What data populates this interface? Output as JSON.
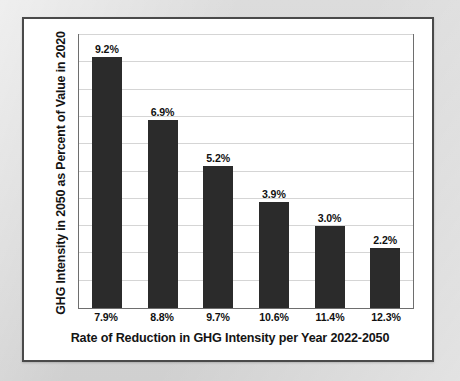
{
  "figure": {
    "background_color": "#d9d9d9",
    "panel_color": "#ffffff",
    "frame_color": "#4a4a4a",
    "bar_color": "#2b2b2b",
    "gridline_color": "#d5d5d5"
  },
  "chart_data": {
    "type": "bar",
    "title": "",
    "xlabel": "Rate of Reduction in GHG Intensity per Year 2022-2050",
    "ylabel": "GHG Intensity in 2050 as Percent of Value in 2020",
    "categories": [
      "7.9%",
      "8.8%",
      "9.7%",
      "10.6%",
      "11.4%",
      "12.3%"
    ],
    "values": [
      9.2,
      6.9,
      5.2,
      3.9,
      3.0,
      2.2
    ],
    "data_labels": [
      "9.2%",
      "6.9%",
      "5.2%",
      "3.9%",
      "3.0%",
      "2.2%"
    ],
    "ylim": [
      0,
      10
    ],
    "y_gridline_step": 1,
    "y_tick_labels_visible": false,
    "grid": true,
    "legend": false,
    "legend_position": "none",
    "series": [
      {
        "name": "GHG Intensity in 2050 as Percent of Value in 2020",
        "values": [
          9.2,
          6.9,
          5.2,
          3.9,
          3.0,
          2.2
        ]
      }
    ]
  }
}
